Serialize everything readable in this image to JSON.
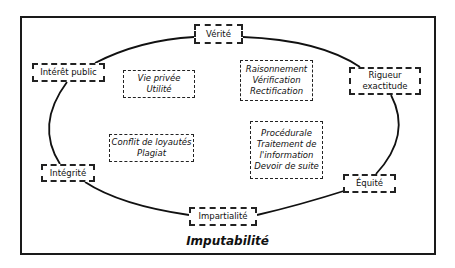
{
  "diagram": {
    "title": "Imputabilité",
    "cycle_nodes": [
      {
        "id": "verite",
        "lines": [
          "Vérité"
        ]
      },
      {
        "id": "rigueur",
        "lines": [
          "Rigueur",
          "exactitude"
        ]
      },
      {
        "id": "equite",
        "lines": [
          "Équité"
        ]
      },
      {
        "id": "impartialite",
        "lines": [
          "Impartialité"
        ]
      },
      {
        "id": "integrite",
        "lines": [
          "Intégrité"
        ]
      },
      {
        "id": "interet-public",
        "lines": [
          "Intérêt public"
        ]
      }
    ],
    "inner_notes": [
      {
        "id": "vie-privee",
        "lines": [
          "Vie privée",
          "Utilité"
        ]
      },
      {
        "id": "raisonnement",
        "lines": [
          "Raisonnement",
          "Vérification",
          "Rectification"
        ]
      },
      {
        "id": "conflit",
        "lines": [
          "Conflit de loyautés",
          "Plagiat"
        ]
      },
      {
        "id": "procedurale",
        "lines": [
          "Procédurale",
          "Traitement de",
          "l'information",
          "Devoir de suite"
        ]
      }
    ],
    "edges": [
      [
        "interet-public",
        "verite"
      ],
      [
        "verite",
        "rigueur"
      ],
      [
        "rigueur",
        "equite"
      ],
      [
        "equite",
        "impartialite"
      ],
      [
        "impartialite",
        "integrite"
      ],
      [
        "integrite",
        "interet-public"
      ]
    ]
  }
}
